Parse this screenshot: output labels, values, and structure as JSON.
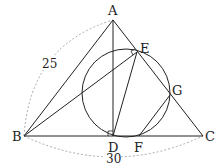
{
  "diagram": {
    "type": "geometry",
    "colors": {
      "line": "#222222",
      "dashed": "#888888",
      "background": "#ffffff"
    },
    "points": {
      "A": {
        "label": "A",
        "x": 113,
        "y": 20
      },
      "B": {
        "label": "B",
        "x": 24,
        "y": 136
      },
      "C": {
        "label": "C",
        "x": 203,
        "y": 136
      },
      "D": {
        "label": "D",
        "x": 113,
        "y": 136
      },
      "E": {
        "label": "E",
        "x": 137,
        "y": 52
      },
      "F": {
        "label": "F",
        "x": 139,
        "y": 136
      },
      "G": {
        "label": "G",
        "x": 170,
        "y": 95
      }
    },
    "circle": {
      "cx": 126,
      "cy": 93,
      "r": 44
    },
    "segments": [
      "AB",
      "AC",
      "BC",
      "AD",
      "BE",
      "DE",
      "FG"
    ],
    "measurements": {
      "AB": "25",
      "BC": "30"
    },
    "right_angle_marks": [
      "D",
      "E"
    ]
  }
}
